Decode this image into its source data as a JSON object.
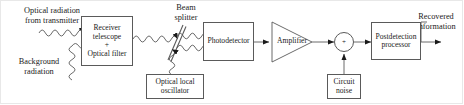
{
  "diagram": {
    "stroke_color": "#5a5a5a",
    "text_color": "#1a1a1a",
    "background": "#ffffff"
  },
  "labels": {
    "optical_radiation": {
      "line1": "Optical radiation",
      "line2": "from transmitter"
    },
    "background_radiation": {
      "line1": "Background",
      "line2": "radiation"
    },
    "beam_splitter": {
      "line1": "Beam",
      "line2": "splitter"
    },
    "recovered_information": {
      "line1": "Recovered",
      "line2": "information"
    }
  },
  "blocks": {
    "receiver_telescope": {
      "line1": "Receiver",
      "line2": "telescope",
      "line3": "+",
      "line4": "Optical filter"
    },
    "optical_local_oscillator": {
      "line1": "Optical local",
      "line2": "oscillator"
    },
    "photodetector": {
      "line1": "Photodetector"
    },
    "amplifier": {
      "line1": "Amplifier"
    },
    "postdetection_processor": {
      "line1": "Postdetection",
      "line2": "processor"
    },
    "circuit_noise": {
      "line1": "Circuit",
      "line2": "noise"
    }
  },
  "junction": {
    "operator": "+"
  }
}
